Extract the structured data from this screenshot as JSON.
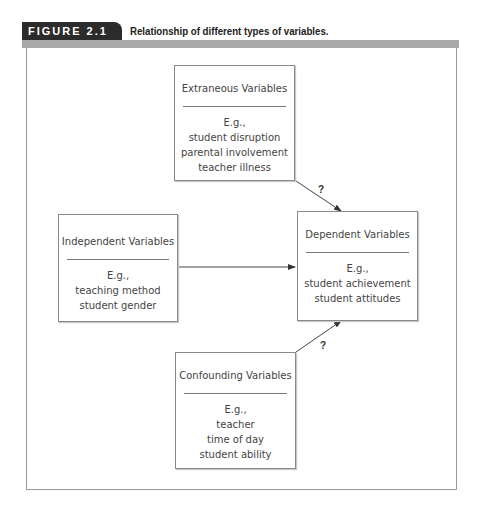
{
  "header": {
    "figure_label": "FIGURE 2.1",
    "caption": "Relationship of different types of variables."
  },
  "boxes": {
    "extraneous": {
      "title": "Extraneous Variables",
      "examples": [
        "E.g.,",
        "student disruption",
        "parental involvement",
        "teacher illness"
      ]
    },
    "independent": {
      "title": "Independent Variables",
      "examples": [
        "E.g.,",
        "teaching method",
        "student gender"
      ]
    },
    "dependent": {
      "title": "Dependent Variables",
      "examples": [
        "E.g.,",
        "student achievement",
        "student attitudes"
      ]
    },
    "confounding": {
      "title": "Confounding Variables",
      "examples": [
        "E.g.,",
        "teacher",
        "time of day",
        "student ability"
      ]
    }
  },
  "arrows": {
    "extraneous_to_dependent_label": "?",
    "confounding_to_dependent_label": "?"
  },
  "colors": {
    "tab": "#2b2b2b",
    "bar": "#a9a9a9",
    "border": "#8a8a8a"
  }
}
